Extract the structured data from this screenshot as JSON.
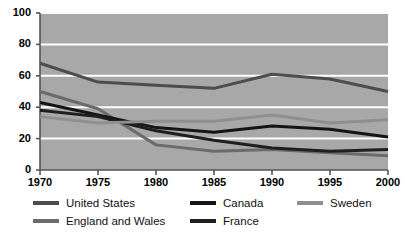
{
  "chart_data": {
    "type": "line",
    "title": "",
    "subtitle": "",
    "xlabel": "",
    "ylabel": "",
    "x": [
      1970,
      1975,
      1980,
      1985,
      1990,
      1995,
      2000
    ],
    "xtick_labels": [
      "1970",
      "1975",
      "1980",
      "1985",
      "1990",
      "1995",
      "2000"
    ],
    "ytick_labels": [
      "0",
      "20",
      "40",
      "60",
      "80",
      "100"
    ],
    "yticks": [
      0,
      20,
      40,
      60,
      80,
      100
    ],
    "xlim": [
      1970,
      2000
    ],
    "ylim": [
      0,
      100
    ],
    "grid": "horizontal",
    "plot_background": "#a8a8a8",
    "gridline_color": "#ffffff",
    "legend_position": "below",
    "series": [
      {
        "name": "United States",
        "color": "#4d4d4d",
        "values": [
          68,
          56,
          54,
          52,
          61,
          58,
          50
        ]
      },
      {
        "name": "England and Wales",
        "color": "#6b6b6b",
        "values": [
          50,
          39,
          16,
          12,
          13,
          11,
          9
        ]
      },
      {
        "name": "Canada",
        "color": "#151515",
        "values": [
          43,
          35,
          27,
          24,
          28,
          26,
          21
        ]
      },
      {
        "name": "France",
        "color": "#1f1f1f",
        "values": [
          38,
          34,
          25,
          19,
          14,
          12,
          13
        ]
      },
      {
        "name": "Sweden",
        "color": "#8f8f8f",
        "values": [
          34,
          30,
          31,
          31,
          35,
          30,
          32
        ]
      }
    ]
  },
  "legend": {
    "items": [
      {
        "label": "United States",
        "color": "#4d4d4d"
      },
      {
        "label": "Canada",
        "color": "#151515"
      },
      {
        "label": "Sweden",
        "color": "#8f8f8f"
      },
      {
        "label": "England and Wales",
        "color": "#6b6b6b"
      },
      {
        "label": "France",
        "color": "#1f1f1f"
      }
    ]
  }
}
